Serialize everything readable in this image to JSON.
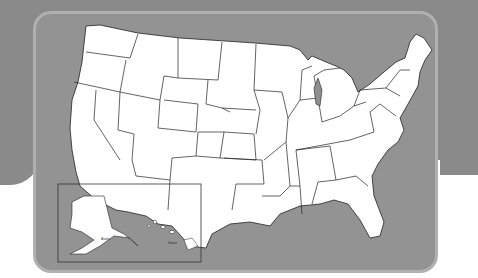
{
  "colors": {
    "background": "#8a8a8a",
    "board": "#939393",
    "board_border": "#b0b0b0",
    "land": "#ffffff",
    "borders": "#222222",
    "water": "#8f8f8f"
  },
  "inset": {
    "labels": [
      "Alaska",
      "Hawaii"
    ]
  }
}
